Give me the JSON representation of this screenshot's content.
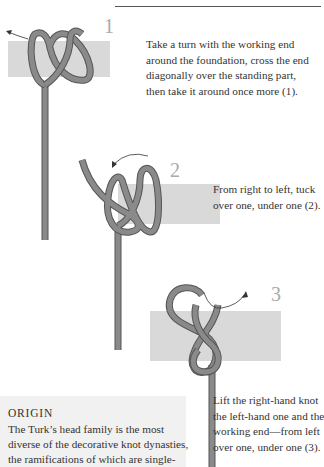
{
  "steps": [
    {
      "number": "1",
      "lines": [
        "Take a turn with the working end",
        "around the foundation, cross the end",
        "diagonally over the standing part,",
        "then take it around once more (1)."
      ]
    },
    {
      "number": "2",
      "lines": [
        "From right to left, tuck",
        "over one, under one (2)."
      ]
    },
    {
      "number": "3",
      "lines": [
        "Lift the right-hand knot",
        "the left-hand one and the",
        "working end—from left",
        "over one, under one (3)."
      ]
    }
  ],
  "origin": {
    "title": "ORIGIN",
    "lines": [
      "The Turk’s head family is the most",
      "diverse of the decorative knot dynasties,",
      "the ramifications of which are single-"
    ]
  },
  "colors": {
    "rope": "#8a8a8a",
    "rope_edge": "#555555",
    "foundation": "#d9d9d9",
    "step_number": "#aaaaaa"
  }
}
